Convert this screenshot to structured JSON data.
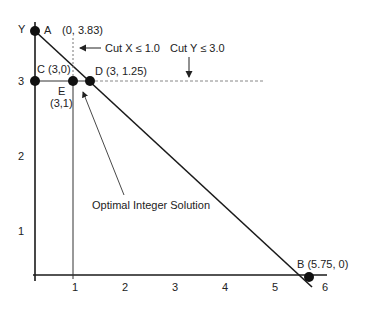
{
  "diagram": {
    "axes": {
      "y_label": "Y",
      "x_ticks": [
        "1",
        "2",
        "3",
        "4",
        "5",
        "6"
      ],
      "y_ticks": [
        "1",
        "2",
        "3"
      ]
    },
    "points": {
      "A": {
        "name": "A",
        "coords": "(0, 3.83)"
      },
      "B": {
        "name": "B",
        "coords": "(5.75, 0)",
        "label": "B (5.75, 0)"
      },
      "C": {
        "name": "C",
        "label": "C (3,0)"
      },
      "D": {
        "name": "D",
        "label": "D (3, 1.25)"
      },
      "E": {
        "name": "E",
        "coords": "(3,1)"
      }
    },
    "cuts": {
      "x_cut": "Cut X ≤ 1.0",
      "y_cut": "Cut Y ≤ 3.0"
    },
    "annotation": "Optimal Integer Solution",
    "colors": {
      "line": "#1a1a1a",
      "point": "#111111",
      "dashed": "#777777"
    }
  }
}
